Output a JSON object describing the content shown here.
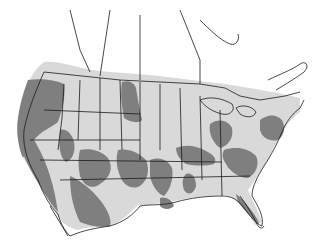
{
  "map": {
    "region": "North America (United States, southern Canada, northern Mexico)",
    "colors": {
      "background": "#ffffff",
      "light_range": "#d9d9d9",
      "dark_range": "#7f7f7f",
      "border": "#1a1a1a"
    },
    "legend": []
  }
}
